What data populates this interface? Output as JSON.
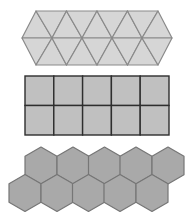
{
  "figure": {
    "width": 195,
    "height": 223,
    "background": "#ffffff",
    "tilings": [
      {
        "name": "triangle-tiling",
        "shape": "triangle",
        "rows": 2,
        "triangle_count": 18,
        "fill": "#d6d6d6",
        "stroke": "#8a8a8a",
        "bounds": {
          "left_tip_x": 22,
          "top_y": 11,
          "mid_y": 38,
          "bottom_y": 65,
          "top_left_x": 36,
          "top_right_x": 158,
          "right_tip_x": 172
        },
        "vertex_columns": 5
      },
      {
        "name": "square-tiling",
        "shape": "square",
        "rows": 2,
        "columns": 5,
        "fill": "#c0c0c0",
        "stroke": "#2e2e2e",
        "bounds": {
          "x": 25,
          "y": 76,
          "width": 144,
          "height": 59
        }
      },
      {
        "name": "hexagon-tiling",
        "shape": "hexagon",
        "rows": 2,
        "per_row": 5,
        "fill": "#a9a9a9",
        "stroke": "#767676",
        "radius": 18.5,
        "row_centers_y": [
          165.5,
          193
        ],
        "top_row_centers_x": [
          41,
          73,
          104.5,
          136,
          168
        ],
        "bottom_row_centers_x": [
          25,
          57,
          88.5,
          120,
          152
        ]
      }
    ]
  }
}
